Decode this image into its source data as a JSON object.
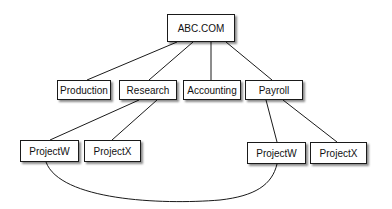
{
  "diagram": {
    "type": "hierarchy",
    "root": {
      "id": "abc",
      "label": "ABC.COM"
    },
    "level1": [
      {
        "id": "production",
        "label": "Production"
      },
      {
        "id": "research",
        "label": "Research"
      },
      {
        "id": "accounting",
        "label": "Accounting"
      },
      {
        "id": "payroll",
        "label": "Payroll"
      }
    ],
    "level2": [
      {
        "id": "research-projectw",
        "parent": "research",
        "label": "ProjectW"
      },
      {
        "id": "research-projectx",
        "parent": "research",
        "label": "ProjectX"
      },
      {
        "id": "payroll-projectw",
        "parent": "payroll",
        "label": "ProjectW"
      },
      {
        "id": "payroll-projectx",
        "parent": "payroll",
        "label": "ProjectX"
      }
    ],
    "edges": [
      [
        "abc",
        "production"
      ],
      [
        "abc",
        "research"
      ],
      [
        "abc",
        "accounting"
      ],
      [
        "abc",
        "payroll"
      ],
      [
        "research",
        "research-projectw"
      ],
      [
        "research",
        "research-projectx"
      ],
      [
        "payroll",
        "payroll-projectw"
      ],
      [
        "payroll",
        "payroll-projectx"
      ],
      [
        "research-projectw",
        "payroll-projectw"
      ]
    ],
    "colors": {
      "line": "#1a1a1a",
      "box_fill": "#ffffff",
      "text": "#111111"
    }
  }
}
